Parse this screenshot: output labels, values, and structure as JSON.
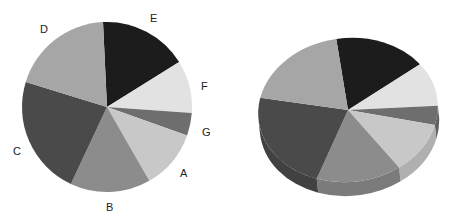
{
  "chart_data": [
    {
      "type": "pie",
      "title": "",
      "variant": "2d",
      "categories": [
        "A",
        "B",
        "C",
        "D",
        "E",
        "F",
        "G"
      ],
      "values": [
        11.3,
        15.3,
        22.8,
        19.5,
        16.9,
        10.0,
        4.3
      ],
      "colors": [
        "#c8c8c8",
        "#8c8c8c",
        "#4a4a4a",
        "#a6a6a6",
        "#1c1c1c",
        "#e2e2e2",
        "#6e6e6e"
      ],
      "labels_shown": true,
      "legend": "none"
    },
    {
      "type": "pie",
      "title": "",
      "variant": "3d",
      "categories": [
        "A",
        "B",
        "C",
        "D",
        "E",
        "F",
        "G"
      ],
      "values": [
        11.3,
        15.3,
        22.8,
        19.5,
        16.9,
        10.0,
        4.3
      ],
      "colors": [
        "#c8c8c8",
        "#8c8c8c",
        "#4a4a4a",
        "#a6a6a6",
        "#1c1c1c",
        "#e2e2e2",
        "#6e6e6e"
      ],
      "labels_shown": false,
      "legend": "none"
    }
  ],
  "labels": {
    "A": "A",
    "B": "B",
    "C": "C",
    "D": "D",
    "E": "E",
    "F": "F",
    "G": "G"
  }
}
